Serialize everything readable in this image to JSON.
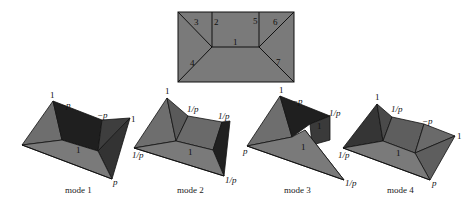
{
  "colors": {
    "background": "#ffffff",
    "face_light": "#7a7a7a",
    "face_mid": "#5e5e5e",
    "face_dark": "#303030",
    "face_black": "#1c1c1c",
    "edge": "#111111"
  },
  "top_pattern": {
    "edge_labels": [
      "1",
      "2",
      "3",
      "4",
      "5",
      "6",
      "7"
    ]
  },
  "modes": [
    {
      "caption": "mode 1",
      "labels": {
        "apex": "1",
        "top_left": "−p",
        "top_right": "−p",
        "right": "1",
        "center": "1",
        "bottom_right": "p"
      }
    },
    {
      "caption": "mode 2",
      "labels": {
        "apex": "1",
        "top_left": "1/p",
        "top_right": "1/p",
        "left": "1/p",
        "center": "1",
        "bottom_right": "1/p"
      }
    },
    {
      "caption": "mode 3",
      "labels": {
        "apex": "1",
        "top_left": "−p",
        "top_right": "1/p",
        "left": "p",
        "center": "1",
        "inner": "1",
        "bottom_right": "1/p"
      }
    },
    {
      "caption": "mode 4",
      "labels": {
        "apex": "1",
        "top_left": "1/p",
        "top_right": "−p",
        "right": "1",
        "left": "1/p",
        "center": "1",
        "bottom_right": "p"
      }
    }
  ]
}
